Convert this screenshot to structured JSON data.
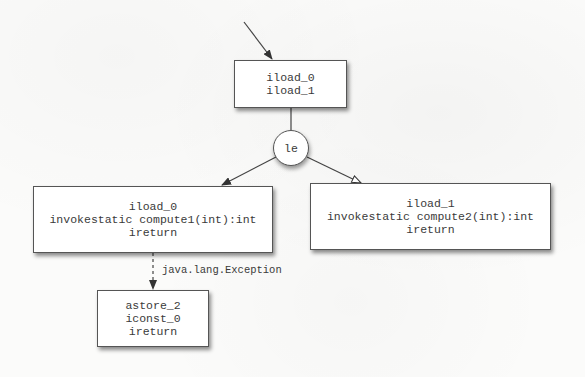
{
  "diagram": {
    "type": "control-flow-graph",
    "nodes": {
      "entry_block": {
        "lines": [
          "iload_0",
          "iload_1"
        ]
      },
      "branch": {
        "label": "le"
      },
      "true_block": {
        "lines": [
          "iload_0",
          "invokestatic compute1(int):int",
          "ireturn"
        ]
      },
      "false_block": {
        "lines": [
          "iload_1",
          "invokestatic compute2(int):int",
          "ireturn"
        ]
      },
      "handler_block": {
        "lines": [
          "astore_2",
          "iconst_0",
          "ireturn"
        ]
      }
    },
    "edges": [
      {
        "from": "start",
        "to": "entry_block",
        "style": "solid",
        "head": "filled"
      },
      {
        "from": "entry_block",
        "to": "branch",
        "style": "solid",
        "head": "none"
      },
      {
        "from": "branch",
        "to": "true_block",
        "style": "solid",
        "head": "filled"
      },
      {
        "from": "branch",
        "to": "false_block",
        "style": "solid",
        "head": "hollow"
      },
      {
        "from": "true_block",
        "to": "handler_block",
        "style": "dashed",
        "head": "filled",
        "label": "java.lang.Exception"
      }
    ],
    "exception_edge_label": "java.lang.Exception",
    "colors": {
      "background": "#fbfbfa",
      "stroke": "#555555",
      "text": "#3a3a3a",
      "node_fill": "#ffffff"
    }
  }
}
